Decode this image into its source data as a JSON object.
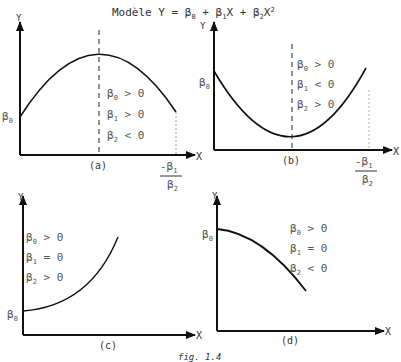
{
  "title": {
    "prefix": "Modèle Y = β",
    "sub0": "0",
    "mid1": " + β",
    "sub1": "1",
    "mid2": "X + β",
    "sub2": "2",
    "suffix": "X",
    "sup": "2"
  },
  "axis_labels": {
    "y": "Y",
    "x": "X"
  },
  "intercept_label": "β",
  "intercept_sub": "0",
  "vertex_label": {
    "num": "-β",
    "num_sub": "1",
    "den": "β",
    "den_sub": "2"
  },
  "panels": [
    {
      "id": "a",
      "caption": "(a)",
      "conditions": [
        {
          "sym": "β",
          "sub": "0",
          "op": ">",
          "val": "0"
        },
        {
          "sym": "β",
          "sub": "1",
          "op": ">",
          "val": "0"
        },
        {
          "sym": "β",
          "sub": "2",
          "op": "<",
          "val": "0"
        }
      ]
    },
    {
      "id": "b",
      "caption": "(b)",
      "conditions": [
        {
          "sym": "β",
          "sub": "0",
          "op": ">",
          "val": "0"
        },
        {
          "sym": "β",
          "sub": "1",
          "op": "<",
          "val": "0"
        },
        {
          "sym": "β",
          "sub": "2",
          "op": ">",
          "val": "0"
        }
      ]
    },
    {
      "id": "c",
      "caption": "(c)",
      "conditions": [
        {
          "sym": "β",
          "sub": "0",
          "op": ">",
          "val": "0"
        },
        {
          "sym": "β",
          "sub": "1",
          "op": "=",
          "val": "0"
        },
        {
          "sym": "β",
          "sub": "2",
          "op": ">",
          "val": "0"
        }
      ]
    },
    {
      "id": "d",
      "caption": "(d)",
      "conditions": [
        {
          "sym": "β",
          "sub": "0",
          "op": ">",
          "val": "0"
        },
        {
          "sym": "β",
          "sub": "1",
          "op": "=",
          "val": "0"
        },
        {
          "sym": "β",
          "sub": "2",
          "op": "<",
          "val": "0"
        }
      ]
    }
  ],
  "figure_caption": "fig. 1.4"
}
